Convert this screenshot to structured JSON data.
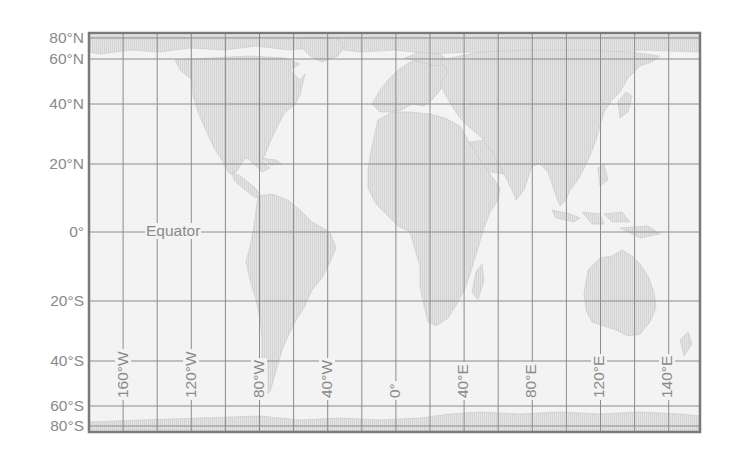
{
  "map": {
    "projection": "Mercator-style world map",
    "colors": {
      "background": "#ffffff",
      "ocean": "#f2f2f2",
      "land": "#e2e2e2",
      "land_hatch": "#d2d2d2",
      "grid": "#8c8c8c",
      "frame": "#7a7a7a",
      "label": "#8a8a8a"
    },
    "latitude_labels": [
      {
        "label": "80°N",
        "y": 38
      },
      {
        "label": "60°N",
        "y": 59
      },
      {
        "label": "40°N",
        "y": 104
      },
      {
        "label": "20°N",
        "y": 164
      },
      {
        "label": "0°",
        "y": 232
      },
      {
        "label": "20°S",
        "y": 301
      },
      {
        "label": "40°S",
        "y": 361
      },
      {
        "label": "60°S",
        "y": 406
      },
      {
        "label": "80°S",
        "y": 426
      }
    ],
    "longitude_labels": [
      {
        "label": "160°W",
        "x": 123
      },
      {
        "label": "120°W",
        "x": 191
      },
      {
        "label": "80°W",
        "x": 259
      },
      {
        "label": "40°W",
        "x": 327
      },
      {
        "label": "0°",
        "x": 395
      },
      {
        "label": "40°E",
        "x": 463
      },
      {
        "label": "80°E",
        "x": 531
      },
      {
        "label": "120°E",
        "x": 599
      },
      {
        "label": "140°E",
        "x": 667
      }
    ],
    "equator_label": "Equator",
    "frame": {
      "left": 89,
      "top": 33,
      "right": 700,
      "bottom": 432
    },
    "grid_spacing_x": 34.1,
    "grid_lines_y": [
      38,
      59,
      104,
      164,
      232,
      301,
      361,
      406,
      426
    ]
  }
}
